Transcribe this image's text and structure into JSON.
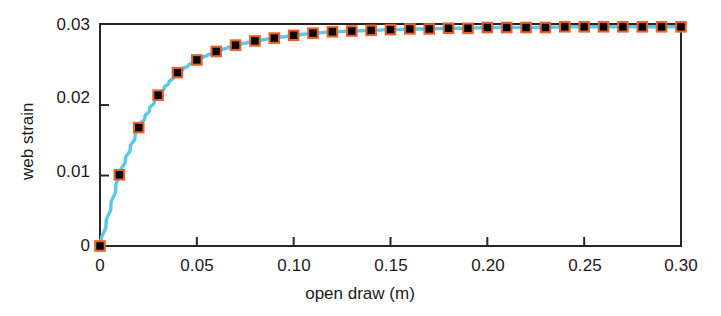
{
  "chart_data": {
    "type": "line",
    "title": "",
    "xlabel": "open draw (m)",
    "ylabel": "web strain",
    "xlim": [
      0,
      0.3
    ],
    "ylim": [
      0,
      0.0315
    ],
    "grid": false,
    "legend": null,
    "xticks": [
      0,
      0.05,
      0.1,
      0.15,
      0.2,
      0.25,
      0.3
    ],
    "xticklabels": [
      "0",
      "0.05",
      "0.10",
      "0.15",
      "0.20",
      "0.25",
      "0.30"
    ],
    "yticks": [
      0,
      0.01,
      0.02,
      0.03
    ],
    "yticklabels": [
      "0",
      "0.01",
      "0.02",
      "0.03"
    ],
    "series": [
      {
        "name": "web strain",
        "marker": "open-square",
        "marker_color": "#E8602C",
        "line_color": "#5BC8EA",
        "x": [
          0.0,
          0.01,
          0.02,
          0.03,
          0.04,
          0.05,
          0.06,
          0.07,
          0.08,
          0.09,
          0.1,
          0.11,
          0.12,
          0.13,
          0.14,
          0.15,
          0.16,
          0.17,
          0.18,
          0.19,
          0.2,
          0.21,
          0.22,
          0.23,
          0.24,
          0.25,
          0.26,
          0.27,
          0.28,
          0.29,
          0.3
        ],
        "values": [
          0.0,
          0.0101,
          0.0168,
          0.0214,
          0.0246,
          0.0264,
          0.0276,
          0.0285,
          0.0291,
          0.0295,
          0.0299,
          0.0302,
          0.0304,
          0.0305,
          0.0306,
          0.0307,
          0.0308,
          0.0308,
          0.0309,
          0.0309,
          0.031,
          0.031,
          0.031,
          0.031,
          0.0311,
          0.0311,
          0.0311,
          0.0311,
          0.0311,
          0.0311,
          0.0311
        ]
      }
    ]
  },
  "colors": {
    "axis": "#262626",
    "line": "#5BC8EA",
    "marker_stroke": "#E8602C",
    "marker_fill": "#FFFFFF",
    "text": "#1a1a1a",
    "background": "#FFFFFF"
  }
}
